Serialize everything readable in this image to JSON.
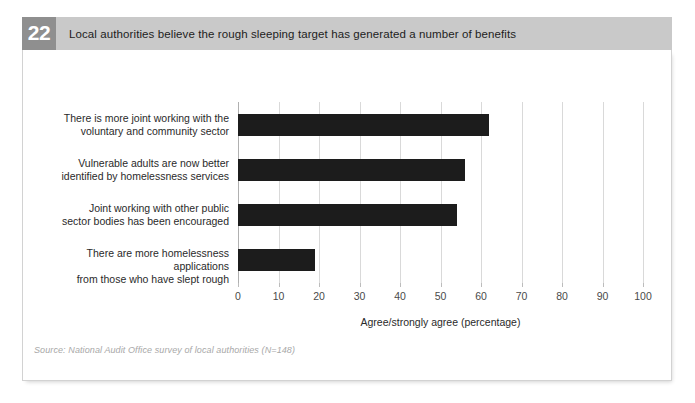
{
  "figure": {
    "number": "22",
    "title": "Local authorities believe the rough sleeping target has generated a number of benefits",
    "source": "Source: National Audit Office survey of local authorities (N=148)"
  },
  "chart_data": {
    "type": "bar",
    "orientation": "horizontal",
    "title": "Local authorities believe the rough sleeping target has generated a number of benefits",
    "categories": [
      "There is more joint working with the voluntary and community sector",
      "Vulnerable adults are now better identified by homelessness services",
      "Joint working with other public sector bodies has been encouraged",
      "There are more homelessness applications from those who have slept rough"
    ],
    "category_lines": [
      [
        "There is more joint working with the",
        "voluntary and community sector"
      ],
      [
        "Vulnerable adults are now better",
        "identified by homelessness services"
      ],
      [
        "Joint working with other public",
        "sector bodies has been encouraged"
      ],
      [
        "There are more homelessness applications",
        "from those who have slept rough"
      ]
    ],
    "values": [
      62,
      56,
      54,
      19
    ],
    "xlabel": "Agree/strongly agree (percentage)",
    "ylabel": "",
    "xlim": [
      0,
      100
    ],
    "xticks": [
      0,
      10,
      20,
      30,
      40,
      50,
      60,
      70,
      80,
      90,
      100
    ],
    "xtick_labels": [
      "0",
      "10",
      "20",
      "30",
      "40",
      "50",
      "60",
      "70",
      "80",
      "90",
      "100"
    ],
    "grid": "vertical",
    "legend": "none",
    "bar_color": "#1c1c1c"
  },
  "colors": {
    "header_bg": "#c9c9c9",
    "badge_bg": "#8f8f8f",
    "badge_text": "#ffffff",
    "bar": "#1c1c1c",
    "gridline": "#d9d9d9",
    "source_text": "#a8a8a8"
  }
}
